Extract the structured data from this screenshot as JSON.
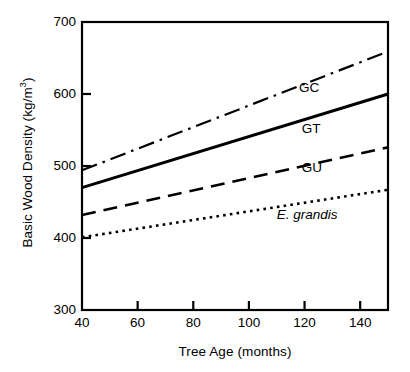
{
  "chart_data": {
    "type": "line",
    "title": "",
    "xlabel": "Tree Age (months)",
    "ylabel": "Basic Wood Density (kg/m3)",
    "ylabel_text": "Basic Wood Density (kg/m",
    "ylabel_sup": "3",
    "ylabel_tail": ")",
    "xlim": [
      40,
      150
    ],
    "ylim": [
      300,
      700
    ],
    "xticks": [
      40,
      60,
      80,
      100,
      120,
      140
    ],
    "yticks": [
      300,
      400,
      500,
      600,
      700
    ],
    "xticklabels": [
      "40",
      "60",
      "80",
      "100",
      "120",
      "140"
    ],
    "yticklabels": [
      "300",
      "400",
      "500",
      "600",
      "700"
    ],
    "grid": false,
    "legend_position": "inline-annotations",
    "series": [
      {
        "name": "GC",
        "label": "GC",
        "linestyle": "dash-dot",
        "color": "#000000",
        "x": [
          40,
          150
        ],
        "values": [
          494,
          659
        ]
      },
      {
        "name": "GT",
        "label": "GT",
        "linestyle": "solid",
        "color": "#000000",
        "x": [
          40,
          150
        ],
        "values": [
          470,
          600
        ]
      },
      {
        "name": "GU",
        "label": "GU",
        "linestyle": "dashed",
        "color": "#000000",
        "x": [
          40,
          150
        ],
        "values": [
          432,
          526
        ]
      },
      {
        "name": "E. grandis",
        "label": "E. grandis",
        "linestyle": "dotted",
        "color": "#000000",
        "x": [
          40,
          150
        ],
        "values": [
          401,
          467
        ]
      }
    ],
    "annotations": [
      {
        "text": "GC",
        "x": 118,
        "y": 609,
        "italic": false
      },
      {
        "text": "GT",
        "x": 119,
        "y": 552,
        "italic": false
      },
      {
        "text": "GU",
        "x": 119,
        "y": 497,
        "italic": false
      },
      {
        "text": "E. grandis",
        "x": 110,
        "y": 432,
        "italic": true
      }
    ]
  },
  "axes": {
    "tick_direction": "in",
    "frame_color": "#000000",
    "background": "#ffffff"
  }
}
